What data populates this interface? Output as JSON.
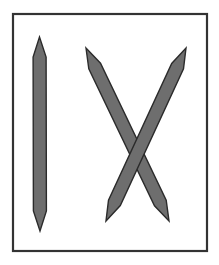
{
  "figure": {
    "description": "Three pencil-shaped sticks inside a rectangular frame: one vertical stick on the left and two sticks crossing to form an X on the right",
    "frame": {
      "x": 13,
      "y": 14,
      "width": 194,
      "height": 237,
      "stroke": "#333333"
    },
    "colors": {
      "stick_fill": "#6e6e6e",
      "stick_outline": "#2b2b2b",
      "background": "#ffffff"
    },
    "sticks": [
      {
        "name": "vertical-stick",
        "from": [
          39.5,
          37
        ],
        "to": [
          40,
          231
        ],
        "half_width": 6.5,
        "tip_length": 20
      },
      {
        "name": "diagonal-stick-descending",
        "from": [
          86,
          48
        ],
        "to": [
          169,
          221
        ],
        "half_width": 6.5,
        "tip_length": 20
      },
      {
        "name": "diagonal-stick-ascending",
        "from": [
          106,
          221
        ],
        "to": [
          186,
          48
        ],
        "half_width": 6.5,
        "tip_length": 20
      }
    ],
    "crossing_point": [
      136,
      145
    ]
  }
}
